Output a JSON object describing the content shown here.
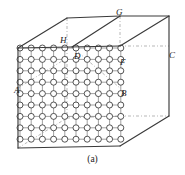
{
  "figure": {
    "caption": "(a)",
    "colors": {
      "box_edge": "#3a3a3a",
      "dashed_edge": "#9a9a9a",
      "lattice_line": "#6e6e6e",
      "atom_stroke": "#2b2b2b",
      "atom_fill": "#ffffff",
      "label_text": "#1a1a1a",
      "background": "#ffffff"
    },
    "labels": [
      {
        "id": "G",
        "text": "G",
        "x": 116,
        "y": 8
      },
      {
        "id": "H",
        "text": "H",
        "x": 60,
        "y": 36
      },
      {
        "id": "D",
        "text": "D",
        "x": 74,
        "y": 52
      },
      {
        "id": "C",
        "text": "C",
        "x": 169,
        "y": 51
      },
      {
        "id": "F",
        "text": "F",
        "x": 120,
        "y": 58
      },
      {
        "id": "A",
        "text": "A",
        "x": 14,
        "y": 86
      },
      {
        "id": "B",
        "text": "B",
        "x": 121,
        "y": 89
      }
    ],
    "box": {
      "solid_edges": [
        {
          "name": "front-top-left-slant",
          "x1": 18,
          "y1": 48,
          "x2": 67,
          "y2": 18
        },
        {
          "name": "back-top-edge",
          "x1": 67,
          "y1": 18,
          "x2": 120,
          "y2": 16
        },
        {
          "name": "top-right-slant",
          "x1": 120,
          "y1": 16,
          "x2": 169,
          "y2": 16
        },
        {
          "name": "g-to-front-slant",
          "x1": 120,
          "y1": 16,
          "x2": 72,
          "y2": 47
        },
        {
          "name": "top-face-right-slant",
          "x1": 169,
          "y1": 16,
          "x2": 120,
          "y2": 46
        },
        {
          "name": "right-vertical",
          "x1": 169,
          "y1": 16,
          "x2": 169,
          "y2": 116
        },
        {
          "name": "front-right-slant-lower",
          "x1": 169,
          "y1": 116,
          "x2": 120,
          "y2": 146
        },
        {
          "name": "bottom-front-edge",
          "x1": 120,
          "y1": 146,
          "x2": 18,
          "y2": 148
        },
        {
          "name": "left-vertical",
          "x1": 18,
          "y1": 48,
          "x2": 18,
          "y2": 148
        },
        {
          "name": "top-front-edge",
          "x1": 18,
          "y1": 48,
          "x2": 120,
          "y2": 46
        }
      ],
      "dashed_edges": [
        {
          "name": "g-vertical-dashed",
          "x1": 120,
          "y1": 16,
          "x2": 120,
          "y2": 46
        },
        {
          "name": "hidden-back-vertical",
          "x1": 67,
          "y1": 18,
          "x2": 67,
          "y2": 48
        },
        {
          "name": "hidden-back-right",
          "x1": 120,
          "y1": 46,
          "x2": 169,
          "y2": 46
        },
        {
          "name": "hidden-back-bottom",
          "x1": 120,
          "y1": 116,
          "x2": 169,
          "y2": 116
        },
        {
          "name": "hidden-interior-diag-a",
          "x1": 18,
          "y1": 148,
          "x2": 67,
          "y2": 118
        },
        {
          "name": "hidden-interior-diag-b",
          "x1": 18,
          "y1": 88,
          "x2": 67,
          "y2": 58
        },
        {
          "name": "hidden-interior-vertical",
          "x1": 67,
          "y1": 48,
          "x2": 67,
          "y2": 118
        },
        {
          "name": "hidden-interior-horizontal",
          "x1": 67,
          "y1": 118,
          "x2": 120,
          "y2": 116
        },
        {
          "name": "hidden-diag-d-to-b",
          "x1": 72,
          "y1": 47,
          "x2": 120,
          "y2": 88
        }
      ]
    },
    "lattice": {
      "columns": 10,
      "rows": 9,
      "x_start": 20,
      "y_start": 48,
      "x_step": 11.2,
      "y_step": 11.4,
      "shear_per_row": 0.0,
      "atom_radius": 3.0
    }
  }
}
